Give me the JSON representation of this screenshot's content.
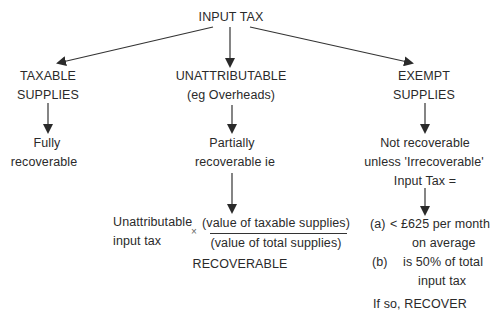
{
  "diagram": {
    "root": {
      "label": "INPUT TAX"
    },
    "branches": [
      {
        "id": "taxable",
        "title_lines": [
          "TAXABLE",
          "SUPPLIES"
        ],
        "outcome_lines": [
          "Fully",
          "recoverable"
        ]
      },
      {
        "id": "unattributable",
        "title_lines": [
          "UNATTRIBUTABLE",
          "(eg Overheads)"
        ],
        "outcome_lines": [
          "Partially",
          "recoverable ie"
        ],
        "formula": {
          "left_lines": [
            "Unattributable",
            "input tax"
          ],
          "operator": "×",
          "numerator": "(value of taxable supplies)",
          "denominator": "(value of total supplies)",
          "result": "RECOVERABLE"
        }
      },
      {
        "id": "exempt",
        "title_lines": [
          "EXEMPT",
          "SUPPLIES"
        ],
        "outcome_lines": [
          "Not recoverable",
          "unless 'Irrecoverable'",
          "Input Tax ="
        ],
        "conditions": [
          {
            "marker": "(a)",
            "lines": [
              "< £625 per month",
              "on average"
            ]
          },
          {
            "marker": "(b)",
            "lines": [
              "is 50% of total",
              "input tax"
            ]
          }
        ],
        "result": "If so, RECOVER"
      }
    ],
    "colors": {
      "text": "#2a2a2a",
      "line": "#333333",
      "background": "#ffffff"
    }
  }
}
